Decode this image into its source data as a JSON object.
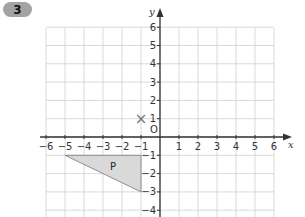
{
  "question": {
    "number": "3"
  },
  "graph": {
    "x_axis": {
      "name": "x",
      "min": -6,
      "max": 6,
      "ticks": [
        "-6",
        "-5",
        "-4",
        "-3",
        "-2",
        "-1",
        "1",
        "2",
        "3",
        "4",
        "5",
        "6"
      ]
    },
    "y_axis": {
      "name": "y",
      "min": -4,
      "max": 6,
      "ticks": [
        "6",
        "5",
        "4",
        "3",
        "2",
        "1",
        "-1",
        "-2",
        "-3",
        "-4"
      ]
    },
    "origin_label": "O",
    "shape": {
      "label": "P",
      "vertices": [
        [
          -5,
          -1
        ],
        [
          -1,
          -1
        ],
        [
          -1,
          -3
        ]
      ],
      "fill": "#d9d9d9"
    },
    "marker": {
      "symbol": "×",
      "x": -1,
      "y": 1
    }
  },
  "colors": {
    "grid": "#cfcfcf",
    "axis": "#333333",
    "badge": "#a3a3a3"
  }
}
